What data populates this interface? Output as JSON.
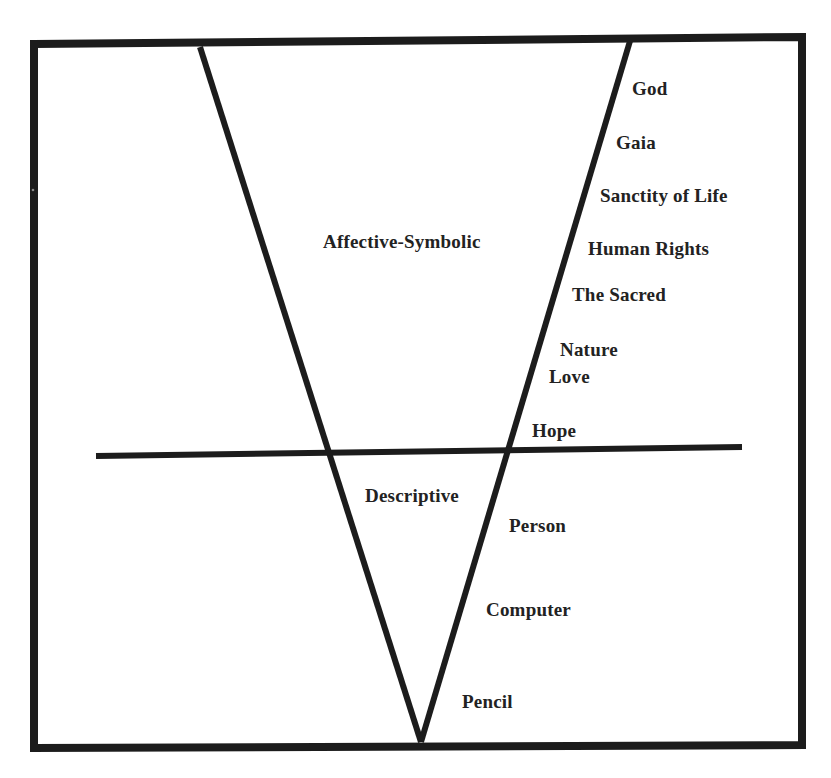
{
  "diagram": {
    "type": "inverted-triangle-scale",
    "colors": {
      "line": "#1c1c1c",
      "background": "#ffffff",
      "text": "#222222"
    },
    "regions": {
      "upper": "Affective-Symbolic",
      "lower": "Descriptive"
    },
    "scale_items": [
      {
        "label": "God"
      },
      {
        "label": "Gaia"
      },
      {
        "label": "Sanctity of Life"
      },
      {
        "label": "Human Rights"
      },
      {
        "label": "The Sacred"
      },
      {
        "label": "Nature"
      },
      {
        "label": "Love"
      },
      {
        "label": "Hope"
      },
      {
        "label": "Person"
      },
      {
        "label": "Computer"
      },
      {
        "label": "Pencil"
      }
    ]
  }
}
